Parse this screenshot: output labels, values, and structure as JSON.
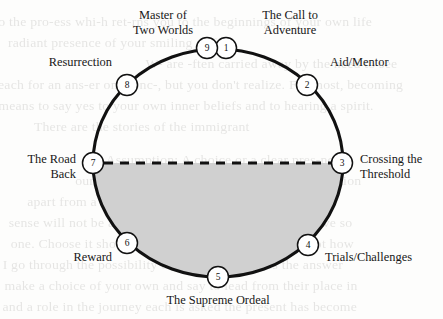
{
  "figure": {
    "colors": {
      "stroke": "#111111",
      "node_fill": "#ffffff",
      "lower_half_fill": "#d0d0d0",
      "background": "#fdfdfc",
      "text": "#171717"
    },
    "geometry": {
      "center_x": 218,
      "center_y": 163,
      "radius_x": 125,
      "radius_y": 114,
      "node_radius": 10.5,
      "divider_style": "dashed"
    },
    "nodes": [
      {
        "number": "1",
        "label": "The Call to\nAdventure",
        "x": 226,
        "y": 48,
        "label_x": 290,
        "label_y": 8,
        "align": "lbl-c"
      },
      {
        "number": "2",
        "label": "Aid/Mentor",
        "x": 307,
        "y": 85,
        "label_x": 330,
        "label_y": 55,
        "align": "lbl-l"
      },
      {
        "number": "3",
        "label": "Crossing the\nThreshold",
        "x": 342,
        "y": 163,
        "label_x": 360,
        "label_y": 152,
        "align": "lbl-l"
      },
      {
        "number": "4",
        "label": "Trials/Challenges",
        "x": 308,
        "y": 245,
        "label_x": 325,
        "label_y": 250,
        "align": "lbl-l"
      },
      {
        "number": "5",
        "label": "The Supreme Ordeal",
        "x": 218,
        "y": 277,
        "label_x": 218,
        "label_y": 293,
        "align": "lbl-c"
      },
      {
        "number": "6",
        "label": "Reward",
        "x": 127,
        "y": 243,
        "label_x": 112,
        "label_y": 250,
        "align": "lbl-r"
      },
      {
        "number": "7",
        "label": "The Road\nBack",
        "x": 93,
        "y": 163,
        "label_x": 76,
        "label_y": 152,
        "align": "lbl-r"
      },
      {
        "number": "8",
        "label": "Resurrection",
        "x": 127,
        "y": 85,
        "label_x": 112,
        "label_y": 55,
        "align": "lbl-r"
      },
      {
        "number": "9",
        "label": "Master of\nTwo Worlds",
        "x": 207,
        "y": 48,
        "label_x": 163,
        "label_y": 8,
        "align": "lbl-c"
      }
    ],
    "ghost_text": [
      {
        "text": "o the pro-ess whi-h ret-rns you to the beginnings of your own life",
        "x": 2,
        "y": 12
      },
      {
        "text": "radiant presence of your smiling self.",
        "x": 10,
        "y": 33
      },
      {
        "text": "W- are -ften carried away by the need to see",
        "x": 148,
        "y": 54
      },
      {
        "text": "each for an ans-er only onc-, but you don't realize. For most, becoming",
        "x": 2,
        "y": 75
      },
      {
        "text": "means to say yes to your own inner beliefs and to hearing a spirit.",
        "x": 2,
        "y": 96
      },
      {
        "text": "There are the stories of the immigrant",
        "x": 36,
        "y": 117
      },
      {
        "text": "Assumption: A choice or a clear pres-nce",
        "x": 108,
        "y": 150
      },
      {
        "text": "our decisions reside in a thought for consideration",
        "x": 78,
        "y": 171
      },
      {
        "text": "apart from a common journey in a second direction",
        "x": 30,
        "y": 192
      },
      {
        "text": "sense will not be a result of the outcome of what we have so",
        "x": 12,
        "y": 213
      },
      {
        "text": "one. Choose it should, it is a we believe and others, not how",
        "x": 14,
        "y": 234
      },
      {
        "text": "I go through the possibility of a little that makes the answer",
        "x": 6,
        "y": 255
      },
      {
        "text": "make a choice of your own and say to lead from their place in",
        "x": 8,
        "y": 276
      },
      {
        "text": "and a role in the journey each is asked the present has become",
        "x": 6,
        "y": 297
      }
    ]
  }
}
